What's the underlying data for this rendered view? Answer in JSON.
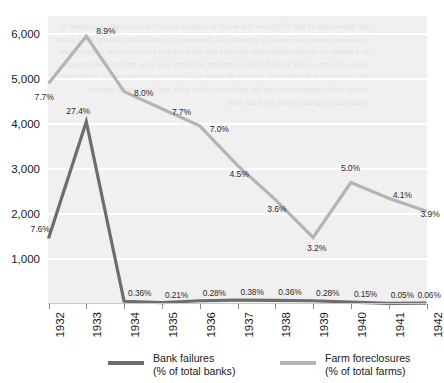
{
  "chart_data": {
    "type": "line",
    "title": "",
    "subtitle": "",
    "xlabel": "",
    "ylabel": "",
    "x": [
      "1932",
      "1933",
      "1934",
      "1935",
      "1936",
      "1937",
      "1938",
      "1939",
      "1940",
      "1941",
      "1942"
    ],
    "categories": [
      "1932",
      "1933",
      "1934",
      "1935",
      "1936",
      "1937",
      "1938",
      "1939",
      "1940",
      "1941",
      "1942"
    ],
    "ylim": [
      0,
      6400
    ],
    "yticks": [
      1000,
      2000,
      3000,
      4000,
      5000,
      6000
    ],
    "ytick_labels": [
      "1,000",
      "2,000",
      "3,000",
      "4,000",
      "5,000",
      "6,000"
    ],
    "grid": true,
    "legend_position": "bottom",
    "series": [
      {
        "name": "Bank failures",
        "unit_label": "(% of total banks)",
        "color": "#6d6d6d",
        "values": [
          1456,
          4050,
          61,
          32,
          72,
          84,
          81,
          72,
          43,
          15,
          20
        ],
        "labels": [
          "7.6%",
          "27.4%",
          "0.36%",
          "0.21%",
          "0.28%",
          "0.38%",
          "0.36%",
          "0.28%",
          "0.15%",
          "0.05%",
          "0.06%"
        ]
      },
      {
        "name": "Farm foreclosures",
        "unit_label": "(% of total farms)",
        "color": "#b4b4b4",
        "values": [
          4900,
          5950,
          4720,
          4340,
          3960,
          3080,
          2320,
          1480,
          2700,
          2350,
          2060
        ],
        "labels": [
          "7.7%",
          "8.9%",
          "8.0%",
          "7.7%",
          "7.0%",
          "4.5%",
          "3.6%",
          "3.2%",
          "5.0%",
          "4.1%",
          "3.9%"
        ]
      }
    ]
  },
  "legend": {
    "items": [
      {
        "name": "Bank failures",
        "detail": "(% of total banks)",
        "color": "#6d6d6d"
      },
      {
        "name": "Farm foreclosures",
        "detail": "(% of total farms)",
        "color": "#b4b4b4"
      }
    ]
  },
  "background": {
    "plot_fill": "#f0f0f0",
    "gridline_color": "#ffffff",
    "page_fill": "#ffffff"
  }
}
